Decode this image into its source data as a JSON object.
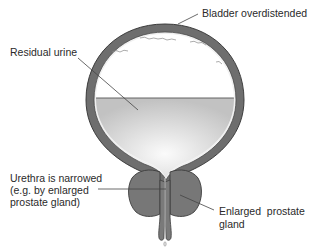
{
  "diagram": {
    "title": "",
    "type": "anatomical-illustration",
    "labels": {
      "bladder": "Bladder overdistended",
      "urine": "Residual urine",
      "urethra_line1": "Urethra is narrowed",
      "urethra_line2": "(e.g. by enlarged",
      "urethra_line3": "prostate gland)",
      "prostate_line1": "Enlarged  prostate",
      "prostate_line2": "gland"
    },
    "colors": {
      "wall": "#6e6e6e",
      "wall_outline": "#3c3c3c",
      "lining": "#f2f2f2",
      "urine_light": "#fafafa",
      "urine_dark": "#c4c4c4",
      "prostate": "#777777",
      "leader_line": "#444444",
      "text": "#2a2a2a"
    }
  }
}
